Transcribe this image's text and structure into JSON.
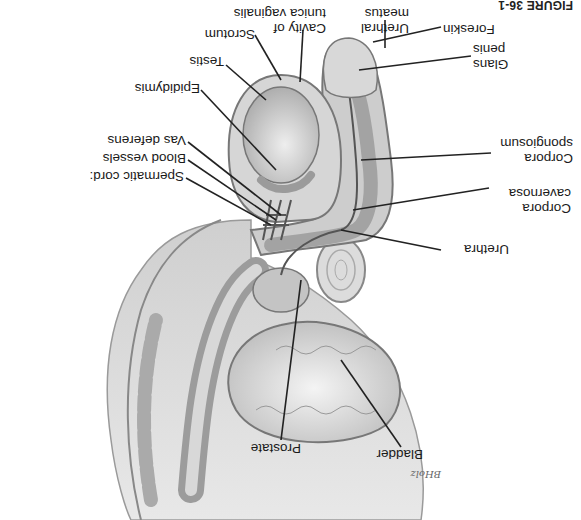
{
  "figure": {
    "orientation": "rotated 180°",
    "caption_prefix": "FIGURE 36-1",
    "caption_rest": "",
    "signature": "BHolz"
  },
  "labels": {
    "urethral_meatus": [
      "Urethral",
      "meatus"
    ],
    "foreskin": "Foreskin",
    "glans_penis": [
      "Glans",
      "penis"
    ],
    "corpora_spongiosum": [
      "Corpora",
      "spongiosum"
    ],
    "corpora_cavernosa": [
      "Corpora",
      "cavernosa"
    ],
    "urethra": "Urethra",
    "cavity_tunica_vaginalis": [
      "Cavity of",
      "tunica vaginalis"
    ],
    "scrotum": "Scrotum",
    "testis": "Testis",
    "epididymis": "Epididymis",
    "vas_deferens": "Vas deferens",
    "blood_vessels": "Blood vessels",
    "spermatic_cord": "Spermatic cord:",
    "prostate": "Prostate",
    "bladder": "Bladder"
  },
  "colors": {
    "tissue_light": "#d9d9d9",
    "tissue_mid": "#b3b3b3",
    "tissue_dark": "#8a8a8a",
    "line": "#222222",
    "text": "#1a1a1a"
  }
}
